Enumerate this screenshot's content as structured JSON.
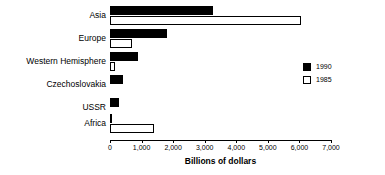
{
  "chart_data": {
    "type": "bar",
    "orientation": "horizontal",
    "title": "",
    "xlabel": "Billions of dollars",
    "ylabel": "",
    "xlim": [
      0,
      7000
    ],
    "xticks": [
      0,
      1000,
      2000,
      3000,
      4000,
      5000,
      6000,
      7000
    ],
    "xtick_labels": [
      "0",
      "1,000",
      "2,000",
      "3,000",
      "4,000",
      "5,000",
      "6,000",
      "7,000"
    ],
    "grid": false,
    "legend_position": "right",
    "categories": [
      "Asia",
      "Europe",
      "Western Hemisphere",
      "Czechoslovakia",
      "USSR",
      "Africa"
    ],
    "series": [
      {
        "name": "1990",
        "color": "#000000",
        "values": [
          3250,
          1800,
          900,
          400,
          300,
          50
        ]
      },
      {
        "name": "1985",
        "color": "#ffffff",
        "values": [
          6050,
          700,
          150,
          0,
          0,
          1400
        ]
      }
    ]
  },
  "legend": {
    "items": [
      {
        "label": "1990",
        "swatch": "filled"
      },
      {
        "label": "1985",
        "swatch": "open"
      }
    ]
  },
  "axis": {
    "x_label": "Billions of dollars"
  },
  "colors": {
    "series_1990": "#000000",
    "series_1985": "#ffffff",
    "axis": "#000000",
    "background": "#ffffff"
  }
}
